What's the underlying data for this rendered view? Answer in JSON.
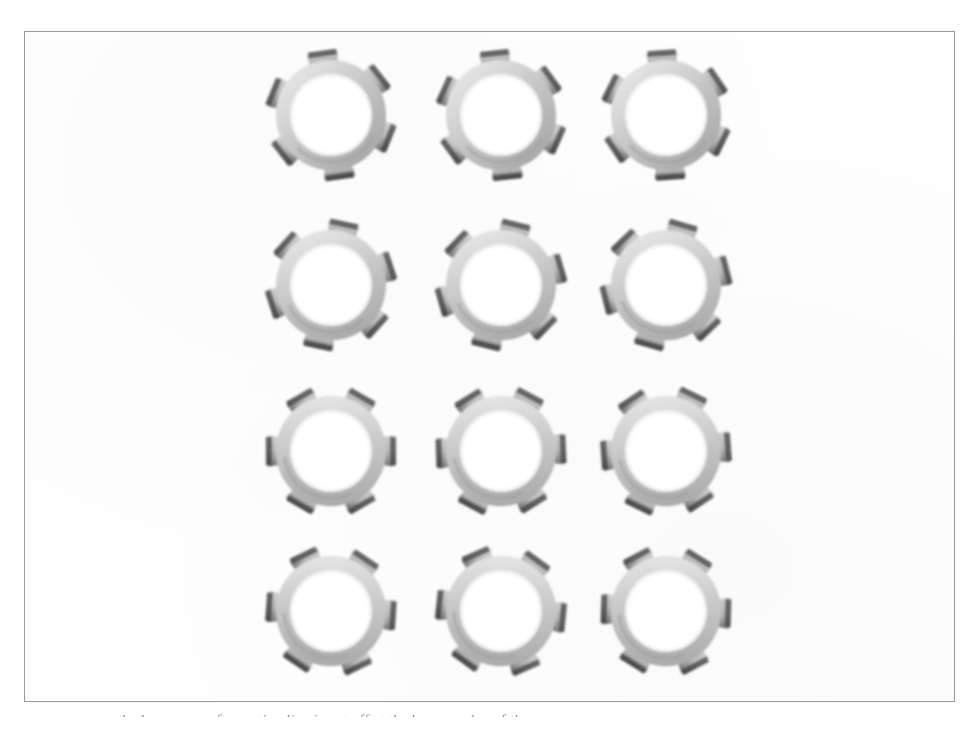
{
  "page": {
    "width": 979,
    "height": 731,
    "background_color": "#ffffff",
    "kind": "scanned-book-figure"
  },
  "plate": {
    "border_color": "#9a9a9a",
    "fill_color": "#fefefe",
    "x": 24,
    "y": 31,
    "width": 931,
    "height": 671
  },
  "figure": {
    "rows": 4,
    "columns": 3,
    "count": 12,
    "tabs_per_washer": 6,
    "colors": {
      "ring_light": "#e6e6e6",
      "ring_mid": "#c9c9c9",
      "ring_shade": "#a8a8a8",
      "tab_light": "#d2d2d2",
      "tab_dark": "#5e5e5e",
      "tab_edge": "#3f3f3f"
    },
    "items": [
      {
        "id": "washer-r1c1",
        "row": 1,
        "col": 1,
        "cx": 306,
        "cy": 83,
        "outer_r": 48,
        "inner_r": 38,
        "tab_len": 17,
        "rotation": -8
      },
      {
        "id": "washer-r1c2",
        "row": 1,
        "col": 2,
        "cx": 476,
        "cy": 83,
        "outer_r": 48,
        "inner_r": 38,
        "tab_len": 17,
        "rotation": -6
      },
      {
        "id": "washer-r1c3",
        "row": 1,
        "col": 3,
        "cx": 641,
        "cy": 83,
        "outer_r": 48,
        "inner_r": 38,
        "tab_len": 17,
        "rotation": -4
      },
      {
        "id": "washer-r2c1",
        "row": 2,
        "col": 1,
        "cx": 306,
        "cy": 253,
        "outer_r": 48,
        "inner_r": 38,
        "tab_len": 17,
        "rotation": 12
      },
      {
        "id": "washer-r2c2",
        "row": 2,
        "col": 2,
        "cx": 476,
        "cy": 253,
        "outer_r": 48,
        "inner_r": 38,
        "tab_len": 17,
        "rotation": 14
      },
      {
        "id": "washer-r2c3",
        "row": 2,
        "col": 3,
        "cx": 641,
        "cy": 253,
        "outer_r": 48,
        "inner_r": 38,
        "tab_len": 17,
        "rotation": 16
      },
      {
        "id": "washer-r3c1",
        "row": 3,
        "col": 1,
        "cx": 306,
        "cy": 419,
        "outer_r": 48,
        "inner_r": 38,
        "tab_len": 17,
        "rotation": 30
      },
      {
        "id": "washer-r3c2",
        "row": 3,
        "col": 2,
        "cx": 476,
        "cy": 419,
        "outer_r": 48,
        "inner_r": 38,
        "tab_len": 17,
        "rotation": 28
      },
      {
        "id": "washer-r3c3",
        "row": 3,
        "col": 3,
        "cx": 641,
        "cy": 419,
        "outer_r": 48,
        "inner_r": 38,
        "tab_len": 17,
        "rotation": 26
      },
      {
        "id": "washer-r4c1",
        "row": 4,
        "col": 1,
        "cx": 306,
        "cy": 579,
        "outer_r": 48,
        "inner_r": 38,
        "tab_len": 17,
        "rotation": 34
      },
      {
        "id": "washer-r4c2",
        "row": 4,
        "col": 2,
        "cx": 476,
        "cy": 579,
        "outer_r": 48,
        "inner_r": 38,
        "tab_len": 17,
        "rotation": 36
      },
      {
        "id": "washer-r4c3",
        "row": 4,
        "col": 3,
        "cx": 641,
        "cy": 579,
        "outer_r": 48,
        "inner_r": 38,
        "tab_len": 17,
        "rotation": 32
      }
    ]
  },
  "caption": {
    "clipped": true,
    "text": "the lower part of a caption line is cut off at the bottom edge of the page"
  }
}
